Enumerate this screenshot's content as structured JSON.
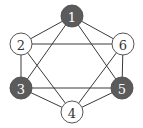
{
  "diagram": {
    "type": "graph",
    "width": 143,
    "height": 128,
    "node_radius": 11,
    "colors": {
      "filled": "#5b5b5b",
      "empty": "#ffffff",
      "filled_text": "#ffffff",
      "empty_text": "#333333",
      "edge": "#3a3a3a"
    },
    "nodes": [
      {
        "id": "1",
        "label": "1",
        "x": 72,
        "y": 16,
        "filled": true
      },
      {
        "id": "2",
        "label": "2",
        "x": 21,
        "y": 44,
        "filled": false
      },
      {
        "id": "3",
        "label": "3",
        "x": 21,
        "y": 88,
        "filled": true
      },
      {
        "id": "4",
        "label": "4",
        "x": 72,
        "y": 112,
        "filled": false
      },
      {
        "id": "5",
        "label": "5",
        "x": 122,
        "y": 88,
        "filled": true
      },
      {
        "id": "6",
        "label": "6",
        "x": 123,
        "y": 44,
        "filled": false
      }
    ],
    "edges": [
      [
        "1",
        "2"
      ],
      [
        "1",
        "6"
      ],
      [
        "1",
        "3"
      ],
      [
        "1",
        "5"
      ],
      [
        "2",
        "6"
      ],
      [
        "2",
        "3"
      ],
      [
        "2",
        "4"
      ],
      [
        "6",
        "5"
      ],
      [
        "6",
        "4"
      ],
      [
        "3",
        "5"
      ],
      [
        "3",
        "4"
      ],
      [
        "5",
        "4"
      ]
    ]
  }
}
